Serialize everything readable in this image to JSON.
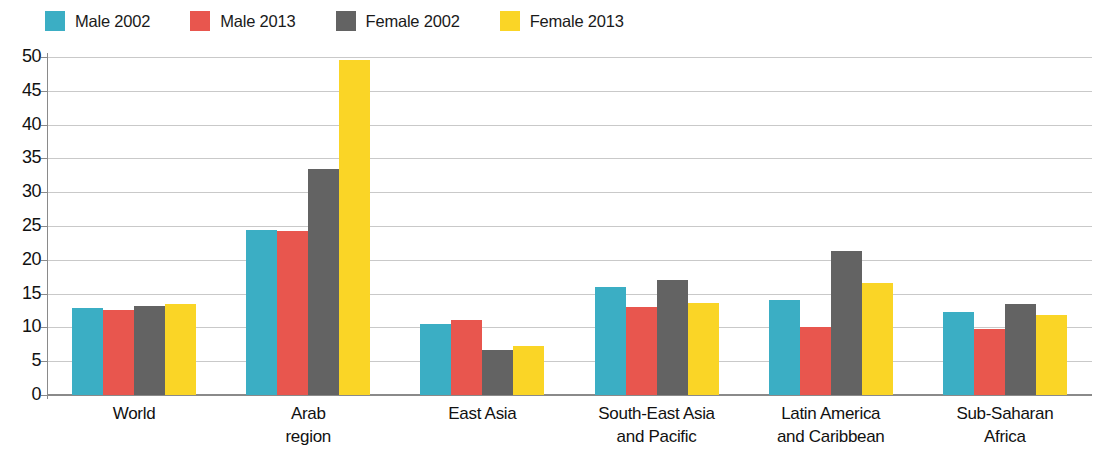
{
  "chart_data": {
    "type": "bar",
    "title": "",
    "subtitle": "",
    "xlabel": "",
    "ylabel": "",
    "ylim": [
      0,
      50
    ],
    "yticks": [
      0,
      5,
      10,
      15,
      20,
      25,
      30,
      35,
      40,
      45,
      50
    ],
    "grid": true,
    "legend_position": "top-left",
    "categories": [
      "World",
      "Arab region",
      "East Asia",
      "South-East Asia and Pacific",
      "Latin America and Caribbean",
      "Sub-Saharan Africa"
    ],
    "category_lines": [
      [
        "World"
      ],
      [
        "Arab",
        "region"
      ],
      [
        "East Asia"
      ],
      [
        "South-East Asia",
        "and Pacific"
      ],
      [
        "Latin America",
        "and Caribbean"
      ],
      [
        "Sub-Saharan",
        "Africa"
      ]
    ],
    "series": [
      {
        "name": "Male 2002",
        "color": "#3BAEC4",
        "values": [
          12.9,
          24.4,
          10.5,
          16.0,
          14.1,
          12.3
        ]
      },
      {
        "name": "Male 2013",
        "color": "#E8564E",
        "values": [
          12.6,
          24.3,
          11.1,
          13.0,
          10.0,
          9.7
        ]
      },
      {
        "name": "Female 2002",
        "color": "#636363",
        "values": [
          13.1,
          33.4,
          6.7,
          17.0,
          21.3,
          13.5
        ]
      },
      {
        "name": "Female 2013",
        "color": "#FAD526",
        "values": [
          13.4,
          49.5,
          7.2,
          13.6,
          16.5,
          11.9
        ]
      }
    ]
  },
  "legend": {
    "items": [
      {
        "label": "Male 2002",
        "color": "#3BAEC4"
      },
      {
        "label": "Male 2013",
        "color": "#E8564E"
      },
      {
        "label": "Female 2002",
        "color": "#636363"
      },
      {
        "label": "Female 2013",
        "color": "#FAD526"
      }
    ]
  }
}
